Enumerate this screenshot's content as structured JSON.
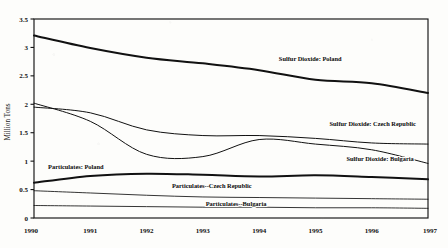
{
  "chart_data": {
    "type": "line",
    "title": "",
    "subtitle": "",
    "xlabel": "",
    "ylabel": "Million Tons",
    "x": [
      1990,
      1991,
      1992,
      1993,
      1994,
      1995,
      1996,
      1997
    ],
    "xticklabels": [
      "1990",
      "1991",
      "1992",
      "1993",
      "1994",
      "1995",
      "1996",
      "1997"
    ],
    "xlim": [
      1990,
      1997
    ],
    "ylim": [
      0,
      3.5
    ],
    "yticks": [
      0,
      0.5,
      1,
      1.5,
      2,
      2.5,
      3,
      3.5
    ],
    "yticklabels": [
      "0",
      "0.5",
      "1",
      "1.5",
      "2",
      "2.5",
      "3",
      "3.5"
    ],
    "grid": false,
    "legend": "inline-labels",
    "series": [
      {
        "name": "Sulfur Dioxide: Poland",
        "label": "Sulfur Dioxide: Poland",
        "values": [
          3.21,
          2.99,
          2.82,
          2.72,
          2.6,
          2.43,
          2.37,
          2.2
        ],
        "linewidth": "thick"
      },
      {
        "name": "Sulfur Dioxide: Czech Republic",
        "label": "Sulfur Dioxide: Czech Republic",
        "values": [
          1.95,
          1.85,
          1.55,
          1.45,
          1.45,
          1.4,
          1.32,
          1.3
        ],
        "linewidth": "med"
      },
      {
        "name": "Sulfur Dioxide: Bulgaria",
        "label": "Sulfur Dioxide: Bulgaria",
        "values": [
          2.02,
          1.7,
          1.12,
          1.08,
          1.38,
          1.3,
          1.2,
          0.96
        ],
        "linewidth": "med"
      },
      {
        "name": "Particulates: Poland",
        "label": "Particulates: Poland",
        "values": [
          0.62,
          0.74,
          0.78,
          0.76,
          0.73,
          0.75,
          0.72,
          0.68
        ],
        "linewidth": "thick"
      },
      {
        "name": "Particulates--Czech Republic",
        "label": "Particulates--Czech Republic",
        "values": [
          0.48,
          0.44,
          0.4,
          0.37,
          0.36,
          0.35,
          0.34,
          0.33
        ],
        "linewidth": "thin"
      },
      {
        "name": "Particulates--Bulgaria",
        "label": "Particulates--Bulgaria",
        "values": [
          0.22,
          0.21,
          0.2,
          0.19,
          0.19,
          0.18,
          0.18,
          0.17
        ],
        "linewidth": "thin"
      }
    ],
    "annotations": [
      {
        "text": "Sulfur Dioxide: Poland",
        "x": 1994.35,
        "y": 2.755
      },
      {
        "text": "Sulfur Dioxide: Czech Republic",
        "x": 1995.25,
        "y": 1.615
      },
      {
        "text": "Sulfur Dioxide: Bulgaria",
        "x": 1995.55,
        "y": 1.01
      },
      {
        "text": "Particulates: Poland",
        "x": 1990.25,
        "y": 0.855
      },
      {
        "text": "Particulates--Czech Republic",
        "x": 1992.45,
        "y": 0.53
      },
      {
        "text": "Particulates--Bulgaria",
        "x": 1993.05,
        "y": 0.205
      }
    ]
  },
  "colors": {
    "line": "#111111",
    "frame": "#141414",
    "text": "#0b0b0b",
    "background": "#fdfdfb"
  }
}
